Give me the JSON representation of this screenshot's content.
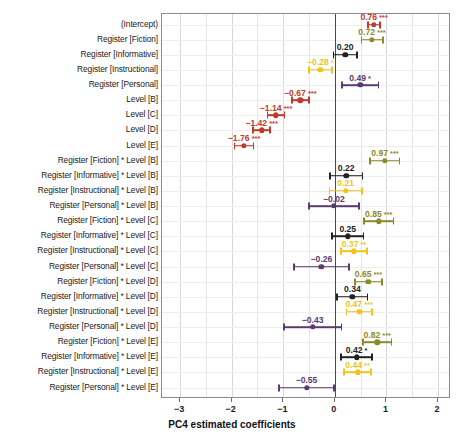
{
  "chart_data": {
    "type": "scatter",
    "plot_kind": "coefficient-forest-plot",
    "title": "",
    "xlabel": "PC4 estimated coefficients",
    "ylabel": "",
    "xlim": [
      -3.35,
      2.25
    ],
    "xticks": [
      -3,
      -2,
      -1,
      0,
      1,
      2
    ],
    "xticklabels": [
      "−3",
      "−2",
      "−1",
      "0",
      "1",
      "2"
    ],
    "grid": true,
    "zero_reference_line": 0,
    "legend": "none",
    "significance_key": {
      "*": "p < 0.05",
      "**": "p < 0.01",
      "***": "p < 0.001"
    },
    "colors": {
      "intercept_and_level": "#c0392b",
      "fiction": "#8a8a2a",
      "informative": "#222222",
      "instructional": "#f0c419",
      "personal": "#5b3a6e"
    },
    "categories": [
      "(Intercept)",
      "Register [Fiction]",
      "Register [Informative]",
      "Register [Instructional]",
      "Register [Personal]",
      "Level [B]",
      "Level [C]",
      "Level [D]",
      "Level [E]",
      "Register [Fiction] * Level [B]",
      "Register [Informative] * Level [B]",
      "Register [Instructional] * Level [B]",
      "Register [Personal] * Level [B]",
      "Register [Fiction] * Level [C]",
      "Register [Informative] * Level [C]",
      "Register [Instructional] * Level [C]",
      "Register [Personal] * Level [C]",
      "Register [Fiction] * Level [D]",
      "Register [Informative] * Level [D]",
      "Register [Instructional] * Level [D]",
      "Register [Personal] * Level [D]",
      "Register [Fiction] * Level [E]",
      "Register [Informative] * Level [E]",
      "Register [Instructional] * Level [E]",
      "Register [Personal] * Level [E]"
    ],
    "points": [
      {
        "label": "(Intercept)",
        "value": 0.76,
        "display": "0.76",
        "stars": "***",
        "lo": 0.63,
        "hi": 0.89,
        "color": "#c0392b"
      },
      {
        "label": "Register [Fiction]",
        "value": 0.72,
        "display": "0.72",
        "stars": "***",
        "lo": 0.5,
        "hi": 0.95,
        "color": "#8a8a2a"
      },
      {
        "label": "Register [Informative]",
        "value": 0.2,
        "display": "0.20",
        "stars": "",
        "lo": -0.04,
        "hi": 0.44,
        "color": "#222222"
      },
      {
        "label": "Register [Instructional]",
        "value": -0.28,
        "display": "−0.28",
        "stars": "*",
        "lo": -0.52,
        "hi": -0.04,
        "color": "#f0c419"
      },
      {
        "label": "Register [Personal]",
        "value": 0.49,
        "display": "0.49",
        "stars": "*",
        "lo": 0.12,
        "hi": 0.86,
        "color": "#5b3a6e"
      },
      {
        "label": "Level [B]",
        "value": -0.67,
        "display": "−0.67",
        "stars": "***",
        "lo": -0.85,
        "hi": -0.49,
        "color": "#c0392b"
      },
      {
        "label": "Level [C]",
        "value": -1.14,
        "display": "−1.14",
        "stars": "***",
        "lo": -1.32,
        "hi": -0.96,
        "color": "#c0392b"
      },
      {
        "label": "Level [D]",
        "value": -1.42,
        "display": "−1.42",
        "stars": "***",
        "lo": -1.6,
        "hi": -1.24,
        "color": "#c0392b"
      },
      {
        "label": "Level [E]",
        "value": -1.76,
        "display": "−1.76",
        "stars": "***",
        "lo": -1.96,
        "hi": -1.56,
        "color": "#c0392b"
      },
      {
        "label": "Register [Fiction] * Level [B]",
        "value": 0.97,
        "display": "0.97",
        "stars": "***",
        "lo": 0.67,
        "hi": 1.27,
        "color": "#8a8a2a"
      },
      {
        "label": "Register [Informative] * Level [B]",
        "value": 0.22,
        "display": "0.22",
        "stars": "",
        "lo": -0.11,
        "hi": 0.55,
        "color": "#222222"
      },
      {
        "label": "Register [Instructional] * Level [B]",
        "value": 0.21,
        "display": "0.21",
        "stars": "",
        "lo": -0.12,
        "hi": 0.54,
        "color": "#f0c419"
      },
      {
        "label": "Register [Personal] * Level [B]",
        "value": -0.02,
        "display": "−0.02",
        "stars": "",
        "lo": -0.52,
        "hi": 0.48,
        "color": "#5b3a6e"
      },
      {
        "label": "Register [Fiction] * Level [C]",
        "value": 0.85,
        "display": "0.85",
        "stars": "***",
        "lo": 0.55,
        "hi": 1.15,
        "color": "#8a8a2a"
      },
      {
        "label": "Register [Informative] * Level [C]",
        "value": 0.25,
        "display": "0.25",
        "stars": "",
        "lo": -0.07,
        "hi": 0.57,
        "color": "#222222"
      },
      {
        "label": "Register [Instructional] * Level [C]",
        "value": 0.37,
        "display": "0.37",
        "stars": "**",
        "lo": 0.1,
        "hi": 0.64,
        "color": "#f0c419"
      },
      {
        "label": "Register [Personal] * Level [C]",
        "value": -0.26,
        "display": "−0.26",
        "stars": "",
        "lo": -0.81,
        "hi": 0.29,
        "color": "#5b3a6e"
      },
      {
        "label": "Register [Fiction] * Level [D]",
        "value": 0.65,
        "display": "0.65",
        "stars": "***",
        "lo": 0.37,
        "hi": 0.93,
        "color": "#8a8a2a"
      },
      {
        "label": "Register [Informative] * Level [D]",
        "value": 0.34,
        "display": "0.34",
        "stars": "",
        "lo": 0.03,
        "hi": 0.65,
        "color": "#222222"
      },
      {
        "label": "Register [Instructional] * Level [D]",
        "value": 0.47,
        "display": "0.47",
        "stars": "***",
        "lo": 0.21,
        "hi": 0.73,
        "color": "#f0c419"
      },
      {
        "label": "Register [Personal] * Level [D]",
        "value": -0.43,
        "display": "−0.43",
        "stars": "",
        "lo": -1.0,
        "hi": 0.14,
        "color": "#5b3a6e"
      },
      {
        "label": "Register [Fiction] * Level [E]",
        "value": 0.82,
        "display": "0.82",
        "stars": "***",
        "lo": 0.53,
        "hi": 1.11,
        "color": "#8a8a2a"
      },
      {
        "label": "Register [Informative] * Level [E]",
        "value": 0.42,
        "display": "0.42",
        "stars": "*",
        "lo": 0.1,
        "hi": 0.74,
        "color": "#222222"
      },
      {
        "label": "Register [Instructional] * Level [E]",
        "value": 0.44,
        "display": "0.44",
        "stars": "**",
        "lo": 0.16,
        "hi": 0.72,
        "color": "#f0c419"
      },
      {
        "label": "Register [Personal] * Level [E]",
        "value": -0.55,
        "display": "−0.55",
        "stars": "",
        "lo": -1.1,
        "hi": 0.0,
        "color": "#5b3a6e"
      }
    ]
  }
}
